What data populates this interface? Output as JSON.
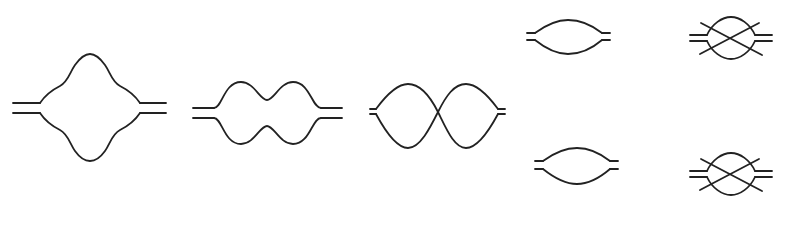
{
  "diagram": {
    "type": "loop-diagrams",
    "stroke_color": "#222222",
    "background": "#ffffff",
    "figures": [
      {
        "id": "fig-1",
        "shape": "four-lobed-loop",
        "description": "Double-line propagators entering a loop with a large central bulge and shoulder wiggles",
        "x_range": [
          13,
          166
        ],
        "y_range": [
          54,
          161
        ]
      },
      {
        "id": "fig-2",
        "shape": "double-bump-loop",
        "description": "Double-line propagators entering a loop pinched in the middle forming two bumps top and bottom",
        "x_range": [
          193,
          342
        ],
        "y_range": [
          82,
          144
        ]
      },
      {
        "id": "fig-3",
        "shape": "figure-eight-loop",
        "description": "Short stubs entering two lens-shaped loops crossing at the center",
        "x_range": [
          370,
          505
        ],
        "y_range": [
          84,
          148
        ]
      },
      {
        "id": "fig-4",
        "shape": "lens-loop",
        "description": "Single lens-shaped loop between double-line stubs (top)",
        "x_range": [
          527,
          610
        ],
        "y_range": [
          20,
          55
        ]
      },
      {
        "id": "fig-5",
        "shape": "lens-loop",
        "description": "Single lens-shaped loop between double-line stubs (bottom)",
        "x_range": [
          535,
          618
        ],
        "y_range": [
          148,
          185
        ]
      },
      {
        "id": "fig-6",
        "shape": "crossed-circle-loop",
        "description": "Circle loop with two crossing diagonal lines and double-line stubs (top)",
        "x_range": [
          690,
          772
        ],
        "y_range": [
          17,
          60
        ]
      },
      {
        "id": "fig-7",
        "shape": "crossed-circle-loop",
        "description": "Circle loop with two crossing diagonal lines and double-line stubs (bottom)",
        "x_range": [
          690,
          772
        ],
        "y_range": [
          152,
          196
        ]
      }
    ]
  }
}
